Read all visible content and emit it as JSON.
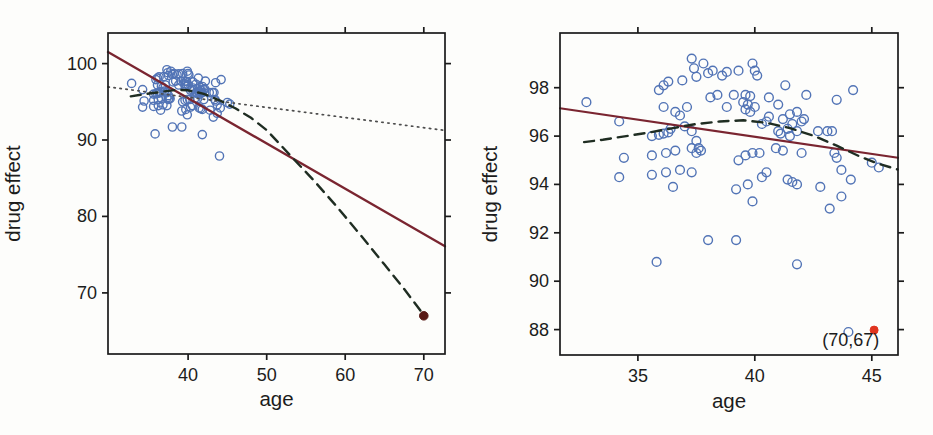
{
  "figure_title": "",
  "colors": {
    "scatter_stroke": "#5274b6",
    "regression_with_outlier": "#7a2530",
    "regression_without_outlier": "#4d4d4d",
    "loess_dashed": "#1f2d22",
    "outlier_fill_dark": "#591a16",
    "outlier_marker_red": "#e0341f",
    "frame": "#1a1a1a",
    "text": "#1c1c1c"
  },
  "dataset": {
    "age": [
      32.8,
      34.2,
      34.4,
      34.2,
      35.6,
      35.6,
      35.6,
      35.8,
      35.9,
      35.9,
      36.1,
      36.1,
      36.1,
      36.2,
      36.2,
      36.3,
      36.3,
      36.4,
      36.5,
      36.6,
      36.6,
      36.8,
      36.8,
      36.9,
      37.0,
      37.1,
      37.3,
      37.3,
      37.3,
      37.3,
      37.4,
      37.5,
      37.5,
      37.5,
      37.6,
      37.7,
      37.8,
      38.0,
      38.0,
      38.1,
      38.2,
      38.4,
      38.6,
      38.8,
      38.8,
      39.1,
      39.2,
      39.2,
      39.3,
      39.3,
      39.5,
      39.6,
      39.6,
      39.6,
      39.7,
      39.7,
      39.8,
      39.8,
      39.9,
      39.9,
      39.9,
      40.0,
      40.0,
      40.1,
      40.2,
      40.3,
      40.3,
      40.5,
      40.5,
      40.6,
      40.6,
      40.9,
      41.0,
      41.0,
      41.1,
      41.2,
      41.2,
      41.3,
      41.4,
      41.4,
      41.5,
      41.5,
      41.6,
      41.6,
      41.8,
      41.8,
      41.8,
      41.8,
      42.0,
      42.0,
      42.1,
      42.2,
      42.7,
      42.8,
      43.1,
      43.2,
      43.3,
      43.4,
      43.5,
      43.5,
      43.7,
      43.7,
      44.0,
      44.1,
      44.2,
      45.0,
      45.3
    ],
    "effect": [
      97.4,
      96.6,
      95.1,
      94.3,
      96.0,
      95.2,
      94.4,
      90.8,
      97.9,
      96.05,
      98.1,
      97.2,
      96.1,
      95.3,
      94.5,
      98.25,
      96.15,
      96.3,
      93.9,
      97.0,
      95.4,
      96.85,
      94.6,
      98.3,
      96.4,
      97.2,
      99.2,
      96.2,
      95.5,
      94.5,
      98.8,
      98.45,
      95.8,
      95.3,
      95.5,
      95.4,
      99.0,
      98.6,
      91.7,
      97.6,
      98.7,
      97.7,
      98.5,
      98.65,
      97.2,
      97.7,
      93.8,
      91.7,
      98.7,
      95.0,
      97.4,
      97.7,
      97.1,
      95.2,
      97.3,
      94.0,
      97.65,
      97.0,
      99.0,
      95.3,
      93.3,
      98.7,
      97.2,
      98.5,
      95.3,
      96.5,
      94.3,
      96.6,
      94.5,
      97.6,
      96.8,
      95.5,
      97.3,
      96.2,
      96.1,
      96.7,
      95.4,
      98.1,
      96.3,
      94.2,
      96.9,
      96.0,
      96.5,
      94.1,
      97.0,
      96.2,
      94.0,
      90.7,
      96.6,
      95.3,
      96.7,
      97.7,
      96.2,
      93.9,
      96.2,
      93.0,
      96.2,
      95.3,
      97.5,
      95.1,
      94.6,
      93.5,
      87.9,
      94.2,
      97.9,
      94.9,
      94.7
    ],
    "outlier": {
      "age": 70,
      "effect": 67
    }
  },
  "chart_data": [
    {
      "type": "scatter",
      "title": "",
      "xlabel": "age",
      "ylabel": "drug effect",
      "xlim": [
        29.8,
        72.7
      ],
      "ylim": [
        62.0,
        104.0
      ],
      "xticks": [
        40,
        50,
        60,
        70
      ],
      "yticks": [
        70,
        80,
        90,
        100
      ],
      "grid": false,
      "legend": "none",
      "marker": "open-circle",
      "points_from": "dataset",
      "lines": [
        {
          "name": "linear-fit-with-outlier",
          "style": "solid",
          "color": "#7a2530",
          "width": 2.3,
          "x": [
            29.8,
            72.7
          ],
          "y": [
            101.5,
            76.1
          ]
        },
        {
          "name": "linear-fit-without-outlier",
          "style": "dotted",
          "color": "#4d4d4d",
          "width": 1.7,
          "x": [
            29.8,
            72.7
          ],
          "y": [
            96.95,
            91.25
          ]
        },
        {
          "name": "loess-fit-with-outlier",
          "style": "dashed",
          "color": "#1f2d22",
          "width": 2.4,
          "x": [
            32.7,
            34.5,
            36.5,
            38.5,
            40,
            42,
            44,
            46,
            48,
            50,
            53,
            56,
            59,
            62,
            65,
            67.5,
            70
          ],
          "y": [
            95.7,
            96.0,
            96.3,
            96.55,
            96.5,
            96.05,
            95.2,
            94.15,
            92.9,
            91.3,
            88.0,
            84.7,
            81.2,
            77.5,
            73.7,
            70.5,
            67.1
          ]
        }
      ],
      "extra_points": [
        {
          "name": "outlier-point",
          "x": 70,
          "y": 67,
          "fill": "#591a16",
          "r": 4.3
        }
      ],
      "annotations": []
    },
    {
      "type": "scatter",
      "title": "",
      "xlabel": "age",
      "ylabel": "drug effect",
      "xlim": [
        31.67,
        46.12
      ],
      "ylim": [
        86.95,
        100.26
      ],
      "xticks": [
        35,
        40,
        45
      ],
      "yticks": [
        88,
        90,
        92,
        94,
        96,
        98
      ],
      "grid": false,
      "legend": "none",
      "marker": "open-circle",
      "points_from": "dataset",
      "lines": [
        {
          "name": "linear-fit-without-outlier",
          "style": "solid",
          "color": "#7a2530",
          "width": 2.1,
          "x": [
            31.67,
            46.12
          ],
          "y": [
            97.15,
            95.1
          ]
        },
        {
          "name": "loess-fit-without-outlier",
          "style": "dashed",
          "color": "#1f2d22",
          "width": 2.4,
          "x": [
            32.7,
            33.5,
            34.5,
            35.5,
            36.5,
            37.5,
            38.5,
            39.5,
            40.5,
            41.5,
            42.5,
            43.5,
            44.5,
            45.3,
            46.1
          ],
          "y": [
            95.75,
            95.85,
            96.0,
            96.15,
            96.33,
            96.5,
            96.6,
            96.65,
            96.55,
            96.33,
            96.02,
            95.6,
            95.15,
            94.85,
            94.62
          ]
        }
      ],
      "extra_points": [
        {
          "name": "outlier-marker-offscale",
          "x": 45.1,
          "y": 87.98,
          "fill": "#e0341f",
          "r": 4.0
        }
      ],
      "annotations": [
        {
          "name": "outlier-coordinates-label",
          "x": 44.1,
          "y": 87.32,
          "text": "(70,67)"
        }
      ]
    }
  ]
}
